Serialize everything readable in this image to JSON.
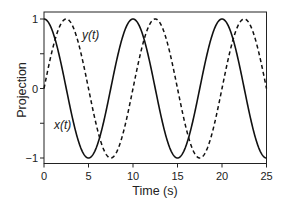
{
  "chart_data": {
    "type": "line",
    "title": "",
    "xlabel": "Time (s)",
    "ylabel": "Projection",
    "xlim": [
      0,
      25
    ],
    "ylim": [
      -1,
      1
    ],
    "xticks": [
      0,
      5,
      10,
      15,
      20,
      25
    ],
    "xtick_labels": [
      "0",
      "5",
      "10",
      "15",
      "20",
      "25"
    ],
    "yticks": [
      1,
      0.5,
      0,
      -0.5,
      -1
    ],
    "ytick_labels": [
      "1",
      "",
      "0",
      "",
      "−1"
    ],
    "grid": false,
    "legend": "none (inline curve labels)",
    "series": [
      {
        "name": "x(t)",
        "style": "solid",
        "color": "#111111",
        "function": "cos(2*pi*t/10)",
        "x": [
          0,
          2.5,
          5,
          7.5,
          10,
          12.5,
          15,
          17.5,
          20,
          22.5,
          25
        ],
        "y": [
          1,
          0,
          -1,
          0,
          1,
          0,
          -1,
          0,
          1,
          0,
          -1
        ]
      },
      {
        "name": "y(t)",
        "style": "dashed",
        "color": "#111111",
        "function": "sin(2*pi*t/10)",
        "x": [
          0,
          2.5,
          5,
          7.5,
          10,
          12.5,
          15,
          17.5,
          20,
          22.5,
          25
        ],
        "y": [
          0,
          1,
          0,
          -1,
          0,
          1,
          0,
          -1,
          0,
          1,
          0
        ]
      }
    ],
    "annotations": [
      {
        "text": "y(t)",
        "x": 4.4,
        "y": 0.77
      },
      {
        "text": "x(t)",
        "x": 1.2,
        "y": -0.53
      }
    ]
  },
  "labels": {
    "xlabel": "Time (s)",
    "ylabel": "Projection",
    "curve_x": "x(t)",
    "curve_y": "y(t)"
  },
  "ticks": {
    "x": [
      "0",
      "5",
      "10",
      "15",
      "20",
      "25"
    ],
    "y": [
      "1",
      "0",
      "−1"
    ]
  }
}
